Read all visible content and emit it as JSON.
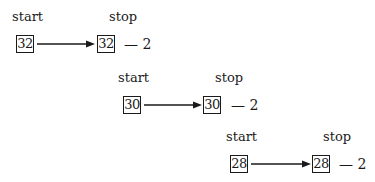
{
  "diagram": {
    "rows": [
      {
        "start_label": "start",
        "stop_label": "stop",
        "start_value": "32",
        "stop_value": "32",
        "decrement": "— 2"
      },
      {
        "start_label": "start",
        "stop_label": "stop",
        "start_value": "30",
        "stop_value": "30",
        "decrement": "— 2"
      },
      {
        "start_label": "start",
        "stop_label": "stop",
        "start_value": "28",
        "stop_value": "28",
        "decrement": "— 2"
      }
    ]
  }
}
